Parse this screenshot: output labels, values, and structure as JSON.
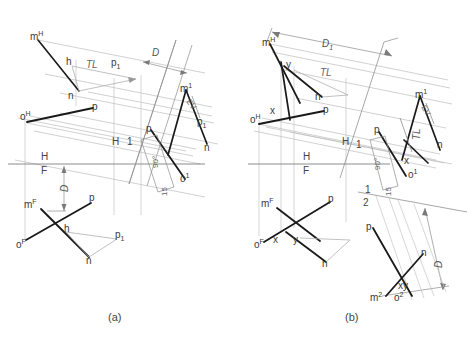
{
  "figure": {
    "captions": {
      "a": "(a)",
      "b": "(b)"
    }
  },
  "panel_a": {
    "name": "panel-a",
    "points": {
      "m_h": "m",
      "m_h_sup": "H",
      "m_1": "m",
      "m_1_sup": "1",
      "m_f": "m",
      "m_f_sup": "F",
      "o_h": "o",
      "o_h_sup": "H",
      "o_1": "o",
      "o_1_sup": "1",
      "o_f": "o",
      "o_f_sup": "F",
      "p_top": "p",
      "p_mid": "p",
      "p_right": "p",
      "p_bottom": "p",
      "p1_top": "p",
      "p1_top_sub": "1",
      "p1_right": "p",
      "p1_right_sub": "1",
      "p1_bottom": "p",
      "p1_bottom_sub": "1",
      "n_top": "n",
      "n_right": "n",
      "n_bottom": "n",
      "h_top": "h",
      "h_bottom": "h"
    },
    "annotations": {
      "tl": "TL",
      "ev": "EV",
      "dim_d_top": "D",
      "dim_d_left": "D",
      "angle_90": "90°",
      "dim_15": "15"
    },
    "fold_lines": {
      "hf_top": "H",
      "hf_bottom": "F",
      "h1_left": "H",
      "h1_right": "1"
    }
  },
  "panel_b": {
    "name": "panel-b",
    "points": {
      "m_h": "m",
      "m_h_sup": "H",
      "m_1": "m",
      "m_1_sup": "1",
      "m_f": "m",
      "m_f_sup": "F",
      "m_2": "m",
      "m_2_sup": "2",
      "o_h": "o",
      "o_h_sup": "H",
      "o_1": "o",
      "o_1_sup": "1",
      "o_f": "o",
      "o_f_sup": "F",
      "o_2": "o",
      "o_2_sup": "2",
      "x_top": "x",
      "x_right": "x",
      "x_bottom": "x",
      "y_top": "y",
      "y_bottom": "y",
      "xy_aux": "xy",
      "p_h": "p",
      "p_1": "p",
      "p_f": "p",
      "p_2": "p",
      "n_h": "n",
      "n_1": "n",
      "n_f": "n",
      "n_2": "n"
    },
    "annotations": {
      "tl_top": "TL",
      "tl_right": "TL",
      "ev": "EV",
      "dim_d1": "D",
      "dim_d1_sub": "1",
      "dim_d2": "D",
      "angle_90": "90°",
      "dim_15": "15"
    },
    "fold_lines": {
      "hf_top": "H",
      "hf_bottom": "F",
      "h1_left": "H",
      "h1_right": "1",
      "12_top": "1",
      "12_bottom": "2"
    }
  },
  "colors": {
    "object_line": "#1a1a1a",
    "projection_line": "#b9b9b9",
    "fold_line": "#808080",
    "dimension_line": "#8c8c8c",
    "text": "#3a3a3a",
    "background": "#ffffff"
  }
}
